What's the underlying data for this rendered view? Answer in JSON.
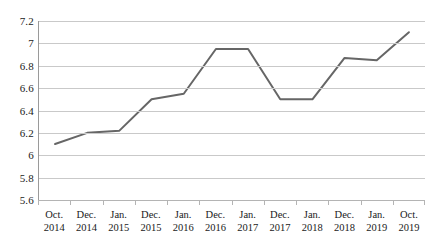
{
  "chart_data": {
    "type": "line",
    "title": "",
    "subtitle": "",
    "xlabel": "",
    "ylabel": "",
    "categories": [
      "Oct. 2014",
      "Dec. 2014",
      "Jan. 2015",
      "Dec. 2015",
      "Jan. 2016",
      "Dec. 2016",
      "Jan. 2017",
      "Dec. 2017",
      "Jan. 2018",
      "Dec. 2018",
      "Jan. 2019",
      "Oct. 2019"
    ],
    "category_parts": [
      {
        "month": "Oct.",
        "year": "2014"
      },
      {
        "month": "Dec.",
        "year": "2014"
      },
      {
        "month": "Jan.",
        "year": "2015"
      },
      {
        "month": "Dec.",
        "year": "2015"
      },
      {
        "month": "Jan.",
        "year": "2016"
      },
      {
        "month": "Dec.",
        "year": "2016"
      },
      {
        "month": "Jan.",
        "year": "2017"
      },
      {
        "month": "Dec.",
        "year": "2017"
      },
      {
        "month": "Jan.",
        "year": "2018"
      },
      {
        "month": "Dec.",
        "year": "2018"
      },
      {
        "month": "Jan.",
        "year": "2019"
      },
      {
        "month": "Oct.",
        "year": "2019"
      }
    ],
    "values": [
      6.1,
      6.2,
      6.22,
      6.5,
      6.55,
      6.95,
      6.95,
      6.5,
      6.5,
      6.87,
      6.85,
      7.1
    ],
    "ylim": [
      5.6,
      7.2
    ],
    "yticks": [
      7.2,
      7,
      6.8,
      6.6,
      6.4,
      6.2,
      6,
      5.8,
      5.6
    ],
    "ytick_labels": [
      "7.2",
      "7",
      "6.8",
      "6.6",
      "6.4",
      "6.2",
      "6",
      "5.8",
      "5.6"
    ],
    "grid": true,
    "legend": false,
    "markers": false,
    "line_color": "#666666",
    "line_width": 2,
    "grid_color": "#c9c9c9",
    "axis_color": "#9a9a9a",
    "background": "#ffffff"
  }
}
